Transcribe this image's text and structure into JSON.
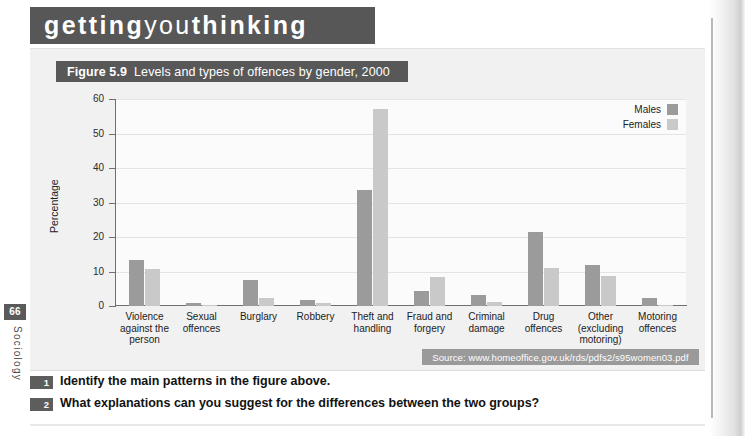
{
  "book": {
    "page_number": "66",
    "running_head": "Sociology"
  },
  "banner": {
    "part1": "getting",
    "part2": "you",
    "part3": "thinking"
  },
  "figure": {
    "label": "Figure 5.9",
    "caption": "Levels and types of offences by gender, 2000",
    "source": "Source: www.homeoffice.gov.uk/rds/pdfs2/s95women03.pdf"
  },
  "legend": {
    "position": "top-right",
    "items": [
      {
        "label": "Males",
        "color": "#9b9b9b"
      },
      {
        "label": "Females",
        "color": "#c9c9c9"
      }
    ]
  },
  "questions": [
    {
      "num": "1",
      "text": "Identify the main patterns in the figure above."
    },
    {
      "num": "2",
      "text": "What explanations can you suggest for the differences between the two groups?"
    }
  ],
  "chart_data": {
    "type": "bar",
    "title": "Levels and types of offences by gender, 2000",
    "xlabel": "",
    "ylabel": "Percentage",
    "ylim": [
      0,
      60
    ],
    "yticks": [
      0,
      10,
      20,
      30,
      40,
      50,
      60
    ],
    "grid": true,
    "legend_position": "top-right",
    "categories": [
      "Violence against the person",
      "Sexual offences",
      "Burglary",
      "Robbery",
      "Theft and handling",
      "Fraud and forgery",
      "Criminal damage",
      "Drug offences",
      "Other (excluding motoring)",
      "Motoring offences"
    ],
    "category_lines": [
      [
        "Violence",
        "against the",
        "person"
      ],
      [
        "Sexual",
        "offences"
      ],
      [
        "Burglary"
      ],
      [
        "Robbery"
      ],
      [
        "Theft and",
        "handling"
      ],
      [
        "Fraud and",
        "forgery"
      ],
      [
        "Criminal",
        "damage"
      ],
      [
        "Drug",
        "offences"
      ],
      [
        "Other",
        "(excluding",
        "motoring)"
      ],
      [
        "Motoring",
        "offences"
      ]
    ],
    "series": [
      {
        "name": "Males",
        "color": "#9b9b9b",
        "values": [
          13.3,
          1.0,
          7.6,
          1.7,
          33.5,
          4.3,
          3.2,
          21.5,
          12.0,
          2.3
        ]
      },
      {
        "name": "Females",
        "color": "#c9c9c9",
        "values": [
          10.7,
          0.1,
          2.2,
          0.8,
          57.0,
          8.5,
          1.3,
          11.0,
          8.8,
          0.4
        ]
      }
    ]
  }
}
